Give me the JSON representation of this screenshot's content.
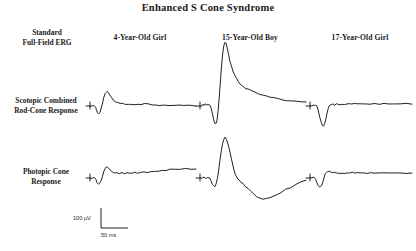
{
  "figure": {
    "title": "Enhanced S Cone Syndrome",
    "corner_label_line1": "Standard",
    "corner_label_line2": "Full-Field ERG",
    "background_color": "#ffffff",
    "trace_color": "#1f1f1f"
  },
  "columns": [
    {
      "label": "4-Year-Old Girl"
    },
    {
      "label": "15-Year-Old Boy"
    },
    {
      "label": "17-Year-Old Girl"
    }
  ],
  "rows": [
    {
      "label_line1": "Scotopic Combined",
      "label_line2": "Rod-Cone Response"
    },
    {
      "label_line1": "Photopic Cone",
      "label_line2": "Response"
    }
  ],
  "scale": {
    "vertical_label": "100 µV",
    "horizontal_label": "50 ms"
  },
  "chart_data": {
    "type": "line",
    "title": "Enhanced S Cone Syndrome",
    "xlabel": "Time (ms)",
    "ylabel": "Amplitude (µV)",
    "grid": false,
    "legend": "none",
    "calibration": {
      "vertical_uv": 100,
      "horizontal_ms": 50
    },
    "panel_columns": [
      "4-Year-Old Girl",
      "15-Year-Old Boy",
      "17-Year-Old Girl"
    ],
    "panel_rows": [
      "Scotopic Combined Rod-Cone Response",
      "Photopic Cone Response"
    ],
    "series": [
      {
        "name": "Scotopic Combined Rod-Cone Response - 4-Year-Old Girl",
        "row": "Scotopic Combined Rod-Cone Response",
        "column": "4-Year-Old Girl",
        "a_wave_amplitude_uv": -18,
        "b_wave_amplitude_uv": 34,
        "points": [
          [
            0,
            0
          ],
          [
            2,
            1
          ],
          [
            4,
            0
          ],
          [
            6,
            -2
          ],
          [
            7,
            -8
          ],
          [
            9,
            -16
          ],
          [
            11,
            -18
          ],
          [
            13,
            -14
          ],
          [
            15,
            -6
          ],
          [
            17,
            6
          ],
          [
            19,
            18
          ],
          [
            21,
            28
          ],
          [
            23,
            33
          ],
          [
            25,
            34
          ],
          [
            27,
            31
          ],
          [
            29,
            25
          ],
          [
            32,
            19
          ],
          [
            35,
            14
          ],
          [
            38,
            11
          ],
          [
            42,
            9
          ],
          [
            46,
            7
          ],
          [
            50,
            5
          ],
          [
            55,
            4
          ],
          [
            60,
            4
          ],
          [
            65,
            3
          ],
          [
            70,
            4
          ],
          [
            75,
            3
          ],
          [
            80,
            4
          ],
          [
            86,
            5
          ],
          [
            92,
            4
          ],
          [
            98,
            3
          ],
          [
            104,
            3
          ],
          [
            110,
            2
          ],
          [
            118,
            3
          ],
          [
            126,
            2
          ],
          [
            134,
            2
          ],
          [
            142,
            1
          ],
          [
            150,
            1
          ],
          [
            160,
            1
          ],
          [
            170,
            0
          ]
        ]
      },
      {
        "name": "Scotopic Combined Rod-Cone Response - 15-Year-Old Boy",
        "row": "Scotopic Combined Rod-Cone Response",
        "column": "15-Year-Old Boy",
        "a_wave_amplitude_uv": -42,
        "b_wave_amplitude_uv": 152,
        "points": [
          [
            0,
            0
          ],
          [
            2,
            4
          ],
          [
            4,
            2
          ],
          [
            6,
            5
          ],
          [
            8,
            3
          ],
          [
            10,
            4
          ],
          [
            12,
            2
          ],
          [
            14,
            1
          ],
          [
            16,
            -6
          ],
          [
            18,
            -18
          ],
          [
            20,
            -32
          ],
          [
            22,
            -40
          ],
          [
            24,
            -42
          ],
          [
            26,
            -34
          ],
          [
            28,
            -10
          ],
          [
            30,
            24
          ],
          [
            32,
            62
          ],
          [
            34,
            98
          ],
          [
            36,
            126
          ],
          [
            38,
            144
          ],
          [
            40,
            152
          ],
          [
            42,
            148
          ],
          [
            44,
            136
          ],
          [
            46,
            122
          ],
          [
            48,
            108
          ],
          [
            51,
            94
          ],
          [
            54,
            82
          ],
          [
            57,
            72
          ],
          [
            60,
            64
          ],
          [
            64,
            56
          ],
          [
            68,
            50
          ],
          [
            72,
            46
          ],
          [
            76,
            42
          ],
          [
            80,
            40
          ],
          [
            85,
            37
          ],
          [
            90,
            34
          ],
          [
            95,
            31
          ],
          [
            100,
            28
          ],
          [
            106,
            25
          ],
          [
            112,
            23
          ],
          [
            118,
            21
          ],
          [
            124,
            19
          ],
          [
            132,
            17
          ],
          [
            140,
            15
          ],
          [
            148,
            13
          ],
          [
            156,
            12
          ],
          [
            164,
            11
          ],
          [
            172,
            10
          ],
          [
            180,
            9
          ]
        ]
      },
      {
        "name": "Scotopic Combined Rod-Cone Response - 17-Year-Old Girl",
        "row": "Scotopic Combined Rod-Cone Response",
        "column": "17-Year-Old Girl",
        "a_wave_amplitude_uv": -48,
        "b_wave_amplitude_uv": 6,
        "points": [
          [
            0,
            0
          ],
          [
            2,
            3
          ],
          [
            4,
            1
          ],
          [
            6,
            2
          ],
          [
            8,
            0
          ],
          [
            10,
            -6
          ],
          [
            12,
            -18
          ],
          [
            14,
            -30
          ],
          [
            16,
            -40
          ],
          [
            18,
            -46
          ],
          [
            20,
            -48
          ],
          [
            22,
            -42
          ],
          [
            24,
            -30
          ],
          [
            26,
            -16
          ],
          [
            28,
            -6
          ],
          [
            30,
            0
          ],
          [
            33,
            3
          ],
          [
            36,
            4
          ],
          [
            39,
            3
          ],
          [
            42,
            5
          ],
          [
            45,
            4
          ],
          [
            48,
            3
          ],
          [
            52,
            5
          ],
          [
            56,
            4
          ],
          [
            60,
            6
          ],
          [
            64,
            5
          ],
          [
            68,
            4
          ],
          [
            73,
            6
          ],
          [
            78,
            5
          ],
          [
            83,
            6
          ],
          [
            88,
            5
          ],
          [
            94,
            6
          ],
          [
            100,
            5
          ],
          [
            108,
            6
          ],
          [
            116,
            5
          ],
          [
            124,
            6
          ],
          [
            132,
            5
          ],
          [
            142,
            6
          ],
          [
            152,
            5
          ],
          [
            162,
            6
          ],
          [
            172,
            5
          ]
        ]
      },
      {
        "name": "Photopic Cone Response - 4-Year-Old Girl",
        "row": "Photopic Cone Response",
        "column": "4-Year-Old Girl",
        "a_wave_amplitude_uv": -16,
        "b_wave_amplitude_uv": 26,
        "points": [
          [
            0,
            0
          ],
          [
            2,
            2
          ],
          [
            4,
            0
          ],
          [
            6,
            -4
          ],
          [
            8,
            -12
          ],
          [
            10,
            -16
          ],
          [
            12,
            -13
          ],
          [
            14,
            -6
          ],
          [
            16,
            4
          ],
          [
            18,
            14
          ],
          [
            20,
            22
          ],
          [
            22,
            26
          ],
          [
            24,
            25
          ],
          [
            26,
            22
          ],
          [
            29,
            18
          ],
          [
            32,
            15
          ],
          [
            35,
            13
          ],
          [
            38,
            12
          ],
          [
            42,
            11
          ],
          [
            46,
            12
          ],
          [
            50,
            11
          ],
          [
            54,
            12
          ],
          [
            58,
            11
          ],
          [
            62,
            12
          ],
          [
            66,
            13
          ],
          [
            70,
            12
          ],
          [
            75,
            13
          ],
          [
            80,
            14
          ],
          [
            85,
            13
          ],
          [
            90,
            15
          ],
          [
            96,
            16
          ],
          [
            102,
            17
          ],
          [
            108,
            18
          ],
          [
            114,
            19
          ],
          [
            120,
            20
          ],
          [
            128,
            21
          ],
          [
            136,
            21
          ],
          [
            144,
            22
          ],
          [
            152,
            21
          ],
          [
            160,
            22
          ]
        ]
      },
      {
        "name": "Photopic Cone Response - 15-Year-Old Boy",
        "row": "Photopic Cone Response",
        "column": "15-Year-Old Boy",
        "a_wave_amplitude_uv": -20,
        "b_wave_amplitude_uv": 96,
        "points": [
          [
            0,
            0
          ],
          [
            3,
            1
          ],
          [
            6,
            0
          ],
          [
            9,
            1
          ],
          [
            12,
            0
          ],
          [
            14,
            -6
          ],
          [
            16,
            -14
          ],
          [
            18,
            -19
          ],
          [
            20,
            -20
          ],
          [
            22,
            -14
          ],
          [
            24,
            -2
          ],
          [
            26,
            18
          ],
          [
            28,
            42
          ],
          [
            30,
            64
          ],
          [
            32,
            82
          ],
          [
            34,
            92
          ],
          [
            36,
            96
          ],
          [
            38,
            92
          ],
          [
            40,
            84
          ],
          [
            42,
            72
          ],
          [
            44,
            58
          ],
          [
            46,
            44
          ],
          [
            48,
            30
          ],
          [
            50,
            18
          ],
          [
            52,
            8
          ],
          [
            54,
            2
          ],
          [
            56,
            -2
          ],
          [
            58,
            -6
          ],
          [
            61,
            -10
          ],
          [
            64,
            -14
          ],
          [
            68,
            -20
          ],
          [
            72,
            -26
          ],
          [
            76,
            -32
          ],
          [
            80,
            -38
          ],
          [
            85,
            -44
          ],
          [
            90,
            -48
          ],
          [
            95,
            -50
          ],
          [
            100,
            -50
          ],
          [
            106,
            -48
          ],
          [
            112,
            -44
          ],
          [
            118,
            -40
          ],
          [
            124,
            -34
          ],
          [
            130,
            -28
          ],
          [
            138,
            -22
          ],
          [
            146,
            -16
          ],
          [
            154,
            -10
          ],
          [
            162,
            -6
          ]
        ]
      },
      {
        "name": "Photopic Cone Response - 17-Year-Old Girl",
        "row": "Photopic Cone Response",
        "column": "17-Year-Old Girl",
        "a_wave_amplitude_uv": -22,
        "b_wave_amplitude_uv": 16,
        "points": [
          [
            0,
            0
          ],
          [
            2,
            2
          ],
          [
            4,
            1
          ],
          [
            6,
            -2
          ],
          [
            8,
            -10
          ],
          [
            10,
            -18
          ],
          [
            12,
            -22
          ],
          [
            14,
            -21
          ],
          [
            16,
            -16
          ],
          [
            18,
            -8
          ],
          [
            20,
            2
          ],
          [
            22,
            10
          ],
          [
            24,
            14
          ],
          [
            26,
            16
          ],
          [
            28,
            15
          ],
          [
            31,
            13
          ],
          [
            34,
            12
          ],
          [
            37,
            13
          ],
          [
            40,
            11
          ],
          [
            43,
            12
          ],
          [
            46,
            11
          ],
          [
            50,
            12
          ],
          [
            54,
            11
          ],
          [
            58,
            13
          ],
          [
            62,
            12
          ],
          [
            66,
            13
          ],
          [
            70,
            12
          ],
          [
            75,
            13
          ],
          [
            80,
            12
          ],
          [
            85,
            13
          ],
          [
            90,
            12
          ],
          [
            96,
            13
          ],
          [
            102,
            12
          ],
          [
            110,
            13
          ],
          [
            118,
            12
          ],
          [
            126,
            13
          ],
          [
            134,
            12
          ],
          [
            144,
            13
          ],
          [
            154,
            12
          ],
          [
            164,
            13
          ]
        ]
      }
    ]
  }
}
